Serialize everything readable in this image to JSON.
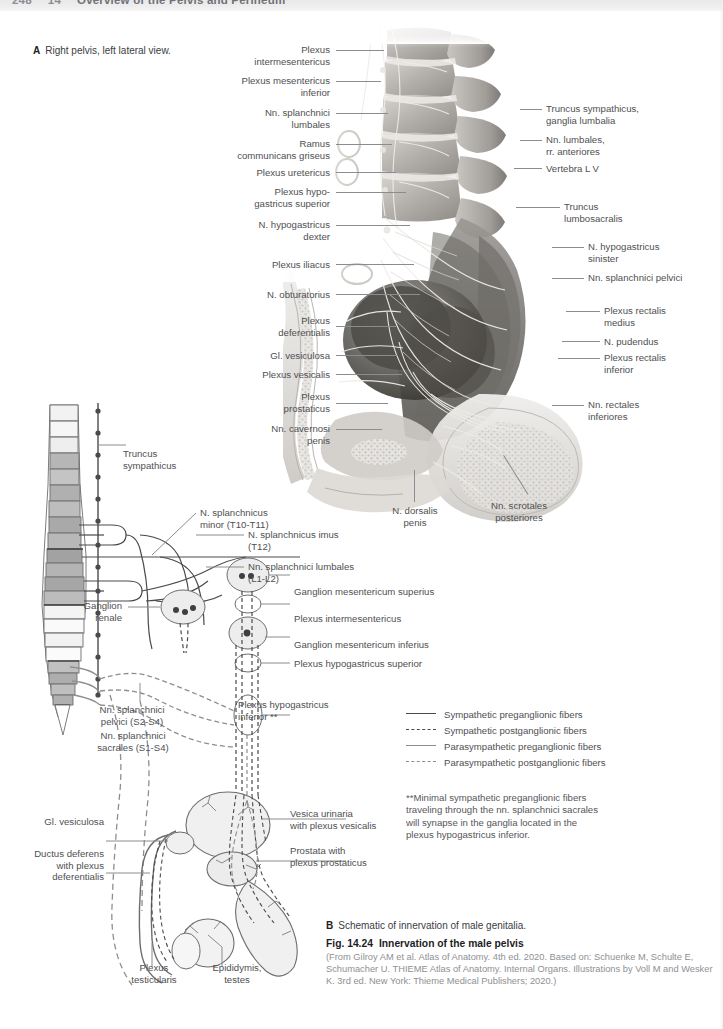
{
  "header": {
    "page_number": "248",
    "chapter_number": "14",
    "running_title": "Overview of the Pelvis and Perineum"
  },
  "panel_a": {
    "marker": "A",
    "caption": "Right pelvis, left lateral view.",
    "labels_left": [
      {
        "text": "Plexus\nintermesentericus"
      },
      {
        "text": "Plexus mesentericus\ninferior"
      },
      {
        "text": "Nn. splanchnici\nlumbales"
      },
      {
        "text": "Ramus\ncommunicans griseus"
      },
      {
        "text": "Plexus uretericus"
      },
      {
        "text": "Plexus hypo-\ngastricus superior"
      },
      {
        "text": "N. hypogastricus\ndexter"
      },
      {
        "text": "Plexus iliacus"
      },
      {
        "text": "N. obturatorius"
      },
      {
        "text": "Plexus\ndeferentialis"
      },
      {
        "text": "Gl. vesiculosa"
      },
      {
        "text": "Plexus vesicalis"
      },
      {
        "text": "Plexus\nprostaticus"
      },
      {
        "text": "Nn. cavernosi\npenis"
      }
    ],
    "labels_right": [
      {
        "text": "Truncus sympathicus,\nganglia lumbalia"
      },
      {
        "text": "Nn. lumbales,\nrr. anteriores"
      },
      {
        "text": "Vertebra L V"
      },
      {
        "text": "Truncus\nlumbosacralis"
      },
      {
        "text": "N. hypogastricus\nsinister"
      },
      {
        "text": "Nn. splanchnici pelvici"
      },
      {
        "text": "Plexus rectalis\nmedius"
      },
      {
        "text": "N. pudendus"
      },
      {
        "text": "Plexus rectalis\ninferior"
      },
      {
        "text": "Nn. rectales\ninferiores"
      }
    ],
    "labels_bottom": [
      {
        "text": "N. dorsalis\npenis"
      },
      {
        "text": "Nn. scrotales\nposteriores"
      }
    ]
  },
  "panel_b": {
    "marker": "B",
    "caption": "Schematic of innervation of male genitalia.",
    "labels_left": [
      {
        "text": "Truncus\nsympathicus"
      },
      {
        "text": "Ganglion\nrenale"
      },
      {
        "text": "Nn. splanchnici\npelvici (S2-S4)"
      },
      {
        "text": "Nn. splanchnici\nsacrales (S1-S4)"
      },
      {
        "text": "Gl. vesiculosa"
      },
      {
        "text": "Ductus deferens\nwith plexus\ndeferentialis"
      }
    ],
    "labels_right": [
      {
        "text": "N. splanchnicus\nminor (T10-T11)"
      },
      {
        "text": "N. splanchnicus imus\n(T12)"
      },
      {
        "text": "Nn. splanchnici lumbales\n(L1-L2)"
      },
      {
        "text": "Ganglion mesentericum superius"
      },
      {
        "text": "Plexus intermesentericus"
      },
      {
        "text": "Ganglion mesentericum inferius"
      },
      {
        "text": "Plexus hypogastricus superior"
      },
      {
        "text": "Plexus hypogastricus\ninferior **"
      },
      {
        "text": "Vesica urinaria\nwith plexus vesicalis"
      },
      {
        "text": "Prostata with\nplexus prostaticus"
      }
    ],
    "labels_bottom": [
      {
        "text": "Plexus\ntesticularis"
      },
      {
        "text": "Epididymis,\ntestes"
      }
    ]
  },
  "legend": {
    "items": [
      {
        "label": "Sympathetic preganglionic fibers",
        "style": "solid-dark"
      },
      {
        "label": "Sympathetic postganglionic fibers",
        "style": "dash-dark"
      },
      {
        "label": "Parasympathetic preganglionic fibers",
        "style": "solid-gray"
      },
      {
        "label": "Parasympathetic postganglionic fibers",
        "style": "dash-gray"
      }
    ]
  },
  "footnote": {
    "text": "**Minimal sympathetic preganglionic fibers traveling through the nn. splanchnici sacrales will synapse in the ganglia located in the plexus hypogastricus inferior."
  },
  "figure": {
    "number": "Fig. 14.24",
    "title": "Innervation of the male pelvis",
    "source": "(From Gilroy AM et al. Atlas of Anatomy. 4th ed. 2020. Based on: Schuenke M, Schulte E, Schumacher U. THIEME Atlas of Anatomy. Internal Organs. Illustrations by Voll M and Wesker K. 3rd ed. New York: Thieme Medical Publishers; 2020.)"
  },
  "colors": {
    "label_text": "#4f4f52",
    "leader_line": "#8b8c8f",
    "caption_gray": "#8e9094",
    "header_band": "#ececed"
  }
}
